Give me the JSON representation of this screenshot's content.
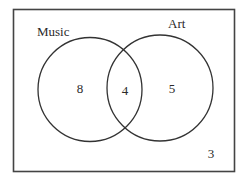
{
  "diagram": {
    "type": "venn",
    "universe": {
      "label": "",
      "outside_count": "3"
    },
    "sets": [
      {
        "name": "Music",
        "only_count": "8"
      },
      {
        "name": "Art",
        "only_count": "5"
      }
    ],
    "intersection_count": "4",
    "colors": {
      "stroke": "#333333",
      "text": "#2a2a2a",
      "background": "#ffffff"
    }
  }
}
